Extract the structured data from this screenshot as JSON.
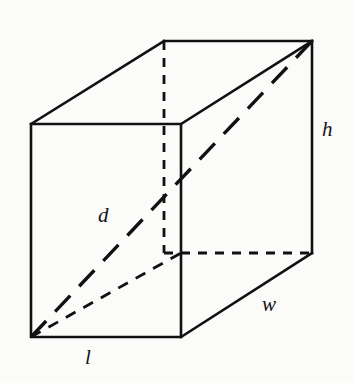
{
  "diagram": {
    "shape": "rectangular-prism",
    "background_color": "#fbfbfa",
    "line_color": "#111111",
    "labels": {
      "length": "l",
      "width": "w",
      "height": "h",
      "diagonal": "d"
    },
    "geometry": {
      "front_face": {
        "top_left": [
          31,
          124
        ],
        "top_right": [
          181,
          124
        ],
        "bottom_right": [
          181,
          337
        ],
        "bottom_left": [
          31,
          337
        ]
      },
      "back_face": {
        "top_left": [
          164,
          41
        ],
        "top_right": [
          312,
          41
        ],
        "bottom_right": [
          312,
          253
        ],
        "bottom_left": [
          164,
          253
        ]
      },
      "space_diagonal": {
        "from": [
          31,
          337
        ],
        "to": [
          312,
          41
        ],
        "style": "long-dash"
      },
      "base_diagonal": {
        "from": [
          31,
          337
        ],
        "to": [
          181,
          253
        ],
        "style": "hidden-dash"
      },
      "hidden_edges": [
        {
          "from": [
            164,
            41
          ],
          "to": [
            164,
            253
          ],
          "name": "back-left-vertical"
        },
        {
          "from": [
            164,
            253
          ],
          "to": [
            312,
            253
          ],
          "name": "back-bottom-horizontal"
        },
        {
          "from": [
            31,
            124
          ],
          "to": [
            164,
            41
          ],
          "name": "top-left-receding"
        }
      ]
    },
    "label_positions": {
      "d": [
        104,
        215
      ],
      "h": [
        328,
        130
      ],
      "w": [
        270,
        305
      ],
      "l": [
        90,
        358
      ]
    }
  }
}
